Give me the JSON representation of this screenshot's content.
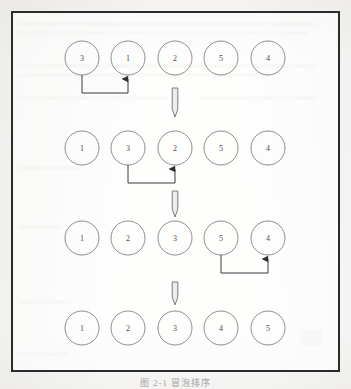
{
  "figure": {
    "caption": "图 2-1  冒泡排序",
    "border_color": "#2b2b2b",
    "circle_stroke": "#8d8d8d",
    "number_color": "#4a4a4a",
    "arrow_color": "#3a3a3a",
    "background": "#fbfbfa"
  },
  "rows": [
    {
      "index": 1,
      "name": "row-1-initial",
      "values": [
        "3",
        "1",
        "2",
        "5",
        "4"
      ],
      "swap": {
        "from_index": 0,
        "to_index": 1,
        "label": "swap-3-and-1"
      }
    },
    {
      "index": 2,
      "name": "row-2-after-first-swap",
      "values": [
        "1",
        "3",
        "2",
        "5",
        "4"
      ],
      "swap": {
        "from_index": 1,
        "to_index": 2,
        "label": "swap-3-and-2"
      }
    },
    {
      "index": 3,
      "name": "row-3-after-second-swap",
      "values": [
        "1",
        "2",
        "3",
        "5",
        "4"
      ],
      "swap": {
        "from_index": 3,
        "to_index": 4,
        "label": "swap-5-and-4"
      }
    },
    {
      "index": 4,
      "name": "row-4-sorted",
      "values": [
        "1",
        "2",
        "3",
        "4",
        "5"
      ],
      "swap": null
    }
  ],
  "step_arrows": [
    {
      "name": "step-arrow-1-to-2",
      "direction": "down"
    },
    {
      "name": "step-arrow-2-to-3",
      "direction": "down"
    },
    {
      "name": "step-arrow-3-to-4",
      "direction": "down"
    }
  ],
  "geometry": {
    "circle_radius": 17,
    "circle_centers_x": [
      82,
      128,
      175,
      221,
      268
    ],
    "row_centers_y": [
      58,
      148,
      238,
      328
    ]
  }
}
